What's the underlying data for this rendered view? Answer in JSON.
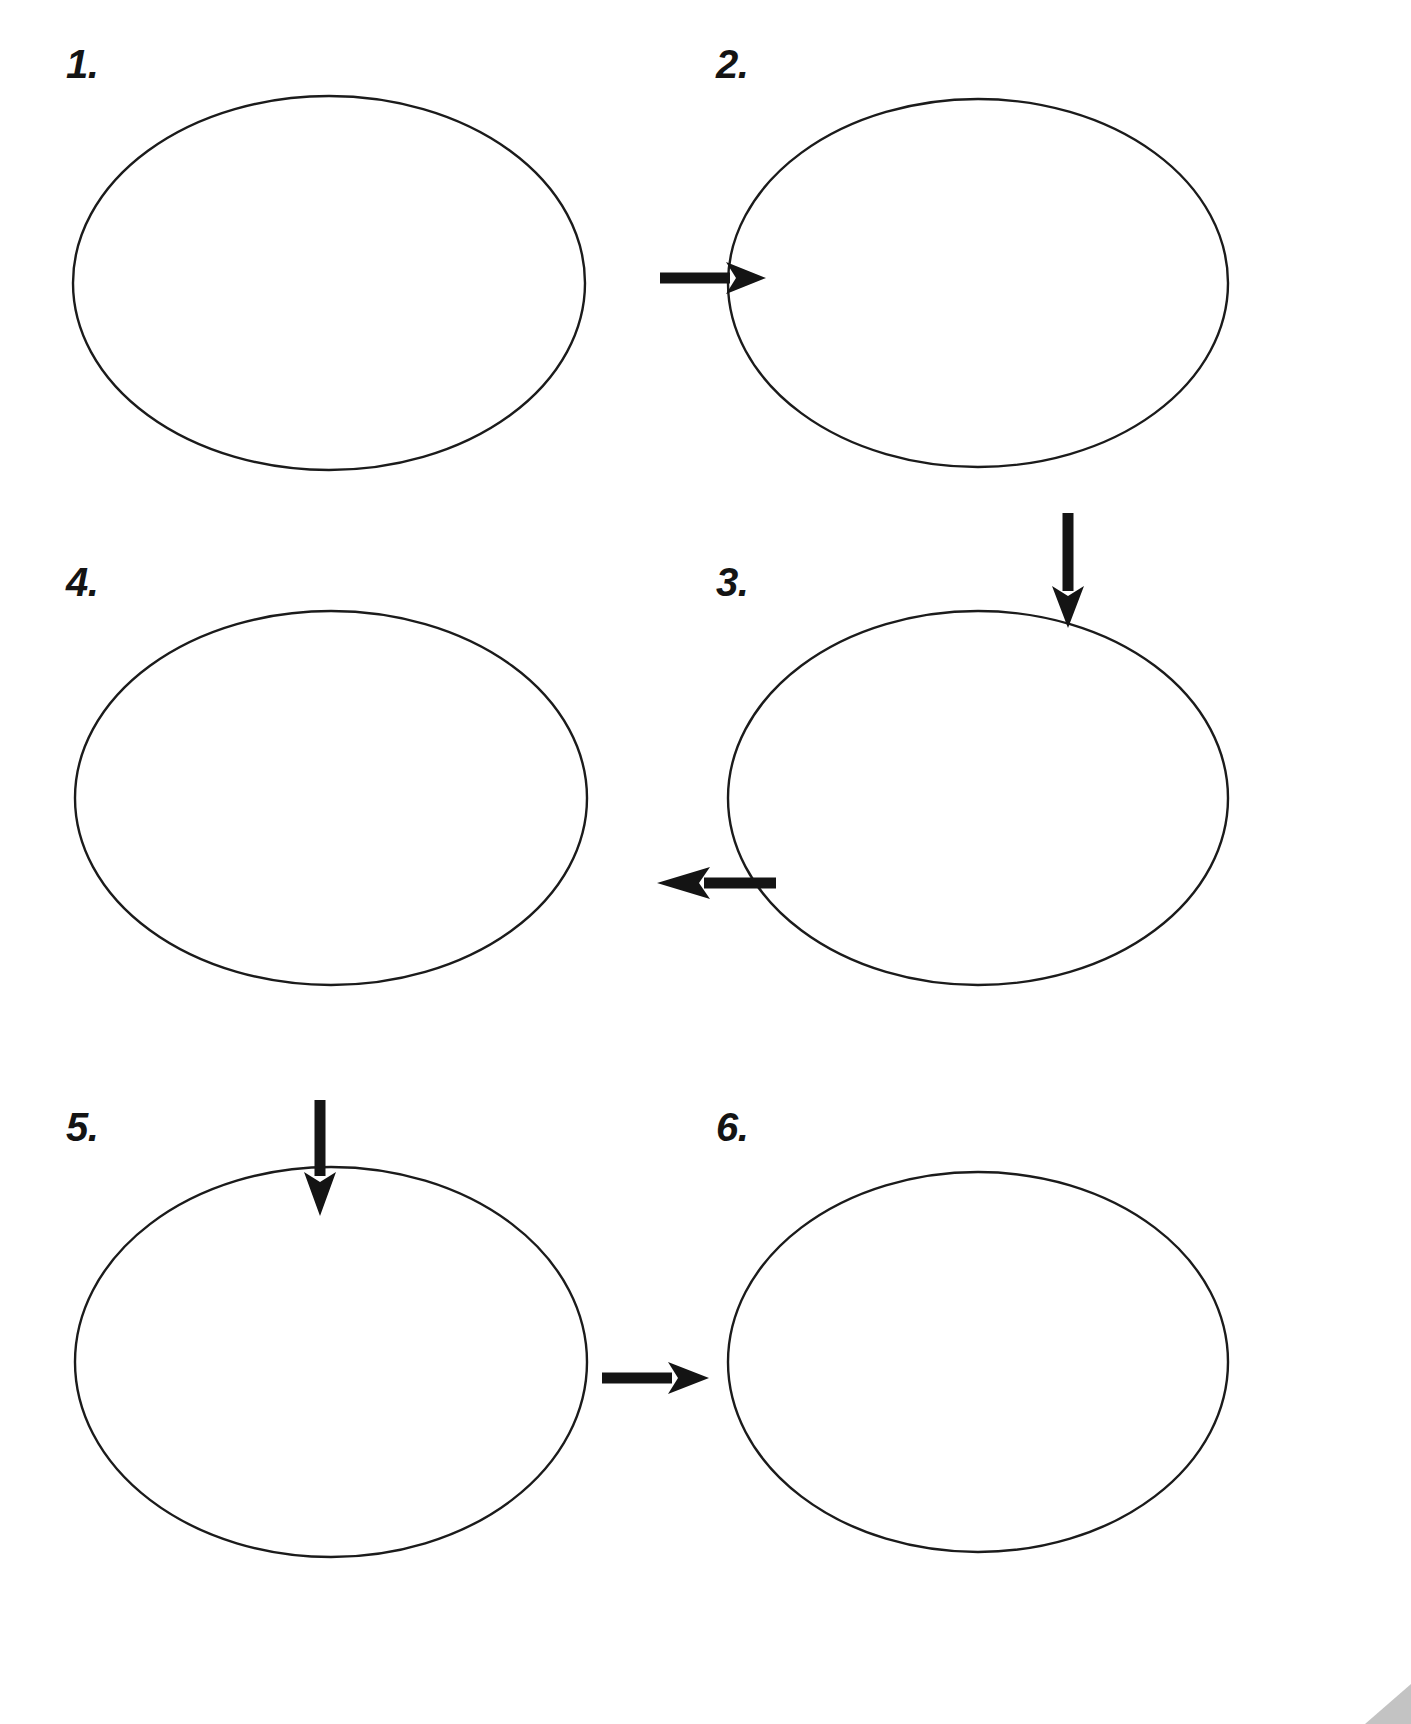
{
  "page": {
    "background_color": "#ffffff",
    "width": 1411,
    "height": 1724
  },
  "style": {
    "oval_stroke_color": "#1b1b1b",
    "oval_fill_color": "#ffffff",
    "oval_stroke_width": 2.2,
    "arrow_color": "#141414",
    "label_color": "#141414",
    "corner_artifact_color": "#b9b9b9"
  },
  "steps": [
    {
      "id": "step-1",
      "label": "1.",
      "label_x": 66,
      "label_y": 44,
      "oval": {
        "cx": 329,
        "cy": 283,
        "rx": 256,
        "ry": 187
      },
      "content": ""
    },
    {
      "id": "step-2",
      "label": "2.",
      "label_x": 716,
      "label_y": 44,
      "oval": {
        "cx": 978,
        "cy": 283,
        "rx": 250,
        "ry": 184
      },
      "content": ""
    },
    {
      "id": "step-3",
      "label": "3.",
      "label_x": 716,
      "label_y": 562,
      "oval": {
        "cx": 978,
        "cy": 798,
        "rx": 250,
        "ry": 187
      },
      "content": ""
    },
    {
      "id": "step-4",
      "label": "4.",
      "label_x": 66,
      "label_y": 562,
      "oval": {
        "cx": 331,
        "cy": 798,
        "rx": 256,
        "ry": 187
      },
      "content": ""
    },
    {
      "id": "step-5",
      "label": "5.",
      "label_x": 66,
      "label_y": 1107,
      "oval": {
        "cx": 331,
        "cy": 1362,
        "rx": 256,
        "ry": 195
      },
      "content": ""
    },
    {
      "id": "step-6",
      "label": "6.",
      "label_x": 716,
      "label_y": 1107,
      "oval": {
        "cx": 978,
        "cy": 1362,
        "rx": 250,
        "ry": 190
      },
      "content": ""
    }
  ],
  "arrows": [
    {
      "id": "arrow-1-to-2",
      "from": "step-1",
      "to": "step-2",
      "direction": "right",
      "x1": 601,
      "y1": 278,
      "x2": 723,
      "y2": 278
    },
    {
      "id": "arrow-2-to-3",
      "from": "step-2",
      "to": "step-3",
      "direction": "down",
      "x1": 971,
      "y1": 471,
      "x2": 971,
      "y2": 603
    },
    {
      "id": "arrow-3-to-4",
      "from": "step-3",
      "to": "step-4",
      "direction": "left",
      "x1": 711,
      "y1": 802,
      "x2": 596,
      "y2": 802
    },
    {
      "id": "arrow-4-to-5",
      "from": "step-4",
      "to": "step-5",
      "direction": "down",
      "x1": 320,
      "y1": 997,
      "x2": 320,
      "y2": 1115
    },
    {
      "id": "arrow-5-to-6",
      "from": "step-5",
      "to": "step-6",
      "direction": "right",
      "x1": 602,
      "y1": 1378,
      "x2": 715,
      "y2": 1378
    }
  ],
  "artifact": {
    "name": "page-corner-shadow",
    "visible": true
  }
}
